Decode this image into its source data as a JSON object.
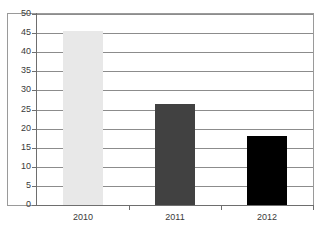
{
  "chart_data": {
    "type": "bar",
    "title": "",
    "subtitle": "",
    "xlabel": "",
    "ylabel": "",
    "categories": [
      "2010",
      "2011",
      "2012"
    ],
    "values": [
      45.5,
      26.5,
      18
    ],
    "series": [
      {
        "name": "",
        "values": [
          45.5,
          26.5,
          18
        ]
      }
    ],
    "ylim": [
      0,
      50
    ],
    "yticks": [
      0,
      5,
      10,
      15,
      20,
      25,
      30,
      35,
      40,
      45,
      50
    ],
    "ytick_labels": [
      "0",
      "5",
      "10",
      "15",
      "20",
      "25",
      "30",
      "35",
      "40",
      "45",
      "50"
    ],
    "grid": true,
    "legend": false,
    "legend_position": "none",
    "bar_colors": [
      "#e8e8e8",
      "#414141",
      "#000000"
    ],
    "axis_color": "#6e6e6e",
    "gridline_color": "#8c8c8c",
    "frame_color": "#9a9a9a",
    "background_color": "#ffffff",
    "annotations": []
  }
}
